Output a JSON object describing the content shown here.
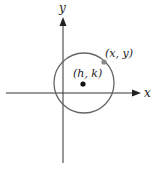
{
  "diagram": {
    "axes": {
      "x_label": "x",
      "y_label": "y",
      "color": "#222222"
    },
    "circle": {
      "color": "#666666"
    },
    "center": {
      "label": "(h, k)",
      "color": "#111111"
    },
    "point": {
      "label": "(x, y)",
      "color": "#888888"
    }
  }
}
